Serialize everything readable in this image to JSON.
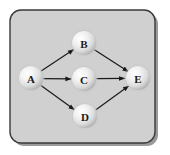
{
  "figure": {
    "name": "directed-acyclic-graph",
    "panel": {
      "fill": "#d0d0d0",
      "border_color": "#3a3a3a",
      "shadow_color": "#9a9a9a",
      "corner_radius": 11,
      "x": 10,
      "y": 10,
      "width": 145,
      "height": 133
    },
    "canvas": {
      "width": 170,
      "height": 155,
      "background": "#ffffff"
    }
  },
  "graph_data": {
    "type": "diagram",
    "layout": "directed-acyclic-graph",
    "node_radius": 12,
    "node_style": {
      "fill_light": "#ffffff",
      "fill_mid": "#e4e4e4",
      "fill_edge": "#b4b4b4",
      "highlight_offset": "35% 32%"
    },
    "edge_style": {
      "color": "#1a1a1a",
      "width": 1.2,
      "arrowhead": "solid-triangle"
    },
    "nodes": [
      {
        "id": "A",
        "label": "A",
        "x": 31,
        "y": 78
      },
      {
        "id": "B",
        "label": "B",
        "x": 84,
        "y": 43
      },
      {
        "id": "C",
        "label": "C",
        "x": 84,
        "y": 79
      },
      {
        "id": "D",
        "label": "D",
        "x": 85,
        "y": 116
      },
      {
        "id": "E",
        "label": "E",
        "x": 138,
        "y": 78
      }
    ],
    "edges": [
      {
        "from": "A",
        "to": "B",
        "directed": true
      },
      {
        "from": "A",
        "to": "C",
        "directed": true
      },
      {
        "from": "A",
        "to": "D",
        "directed": true
      },
      {
        "from": "B",
        "to": "E",
        "directed": true
      },
      {
        "from": "C",
        "to": "E",
        "directed": true
      },
      {
        "from": "D",
        "to": "E",
        "directed": true
      }
    ]
  }
}
